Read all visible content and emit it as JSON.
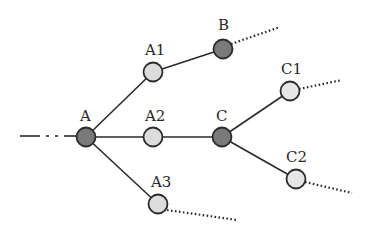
{
  "diagram": {
    "type": "tree",
    "colors": {
      "dark_node": "#7a7a7a",
      "light_node": "#dcdcdc",
      "edge": "#2b2b2b"
    },
    "nodes": [
      {
        "id": "A",
        "label": "A",
        "shade": "dark"
      },
      {
        "id": "A1",
        "label": "A1",
        "shade": "light"
      },
      {
        "id": "A2",
        "label": "A2",
        "shade": "light"
      },
      {
        "id": "A3",
        "label": "A3",
        "shade": "light"
      },
      {
        "id": "B",
        "label": "B",
        "shade": "dark"
      },
      {
        "id": "C",
        "label": "C",
        "shade": "dark"
      },
      {
        "id": "C1",
        "label": "C1",
        "shade": "light"
      },
      {
        "id": "C2",
        "label": "C2",
        "shade": "light"
      }
    ],
    "edges": [
      {
        "from": "incoming",
        "to": "A",
        "style": "dash-dot"
      },
      {
        "from": "A",
        "to": "A1",
        "style": "solid"
      },
      {
        "from": "A",
        "to": "A2",
        "style": "solid"
      },
      {
        "from": "A",
        "to": "A3",
        "style": "solid"
      },
      {
        "from": "A1",
        "to": "B",
        "style": "solid"
      },
      {
        "from": "A2",
        "to": "C",
        "style": "solid"
      },
      {
        "from": "C",
        "to": "C1",
        "style": "solid"
      },
      {
        "from": "C",
        "to": "C2",
        "style": "solid"
      },
      {
        "from": "B",
        "to": "continues",
        "style": "dotted"
      },
      {
        "from": "C1",
        "to": "continues",
        "style": "dotted"
      },
      {
        "from": "C2",
        "to": "continues",
        "style": "dotted"
      },
      {
        "from": "A3",
        "to": "continues",
        "style": "dotted"
      }
    ]
  }
}
